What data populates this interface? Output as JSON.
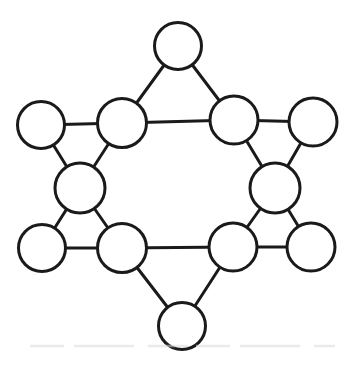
{
  "diagram": {
    "type": "graph",
    "canvas": {
      "width": 354,
      "height": 366
    },
    "style": {
      "background_color": "#ffffff",
      "stroke_color": "#1a1a1a",
      "stroke_width": 3,
      "node_fill": "#ffffff"
    },
    "nodes": [
      {
        "id": "top-point",
        "label": "",
        "x": 178,
        "y": 46,
        "r": 23.5
      },
      {
        "id": "outer-upper-left",
        "label": "",
        "x": 41,
        "y": 125,
        "r": 23.5
      },
      {
        "id": "inner-upper-left",
        "label": "",
        "x": 122,
        "y": 123,
        "r": 24.5
      },
      {
        "id": "inner-upper-right",
        "label": "",
        "x": 234,
        "y": 120,
        "r": 24
      },
      {
        "id": "outer-upper-right",
        "label": "",
        "x": 313,
        "y": 122,
        "r": 24
      },
      {
        "id": "mid-left",
        "label": "",
        "x": 80,
        "y": 188,
        "r": 25
      },
      {
        "id": "mid-right",
        "label": "",
        "x": 275,
        "y": 188,
        "r": 25
      },
      {
        "id": "outer-lower-left",
        "label": "",
        "x": 42,
        "y": 248,
        "r": 23.5
      },
      {
        "id": "inner-lower-left",
        "label": "",
        "x": 122,
        "y": 248,
        "r": 24.5
      },
      {
        "id": "inner-lower-right",
        "label": "",
        "x": 233,
        "y": 247,
        "r": 24
      },
      {
        "id": "outer-lower-right",
        "label": "",
        "x": 311,
        "y": 247,
        "r": 24
      },
      {
        "id": "bottom-point",
        "label": "",
        "x": 182,
        "y": 326,
        "r": 23.5
      }
    ],
    "edges": [
      [
        "top-point",
        "inner-upper-left"
      ],
      [
        "top-point",
        "inner-upper-right"
      ],
      [
        "inner-upper-left",
        "inner-upper-right"
      ],
      [
        "outer-upper-left",
        "inner-upper-left"
      ],
      [
        "outer-upper-left",
        "mid-left"
      ],
      [
        "inner-upper-left",
        "mid-left"
      ],
      [
        "outer-upper-right",
        "inner-upper-right"
      ],
      [
        "outer-upper-right",
        "mid-right"
      ],
      [
        "inner-upper-right",
        "mid-right"
      ],
      [
        "mid-left",
        "outer-lower-left"
      ],
      [
        "mid-left",
        "inner-lower-left"
      ],
      [
        "outer-lower-left",
        "inner-lower-left"
      ],
      [
        "mid-right",
        "inner-lower-right"
      ],
      [
        "mid-right",
        "outer-lower-right"
      ],
      [
        "inner-lower-right",
        "outer-lower-right"
      ],
      [
        "inner-lower-left",
        "inner-lower-right"
      ],
      [
        "inner-lower-left",
        "bottom-point"
      ],
      [
        "inner-lower-right",
        "bottom-point"
      ]
    ]
  }
}
